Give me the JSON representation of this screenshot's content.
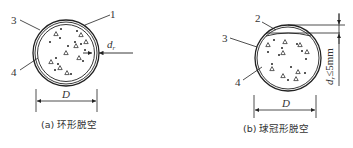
{
  "figure_a": {
    "caption": "(a) 环形脱空",
    "labels": {
      "one": "1",
      "three": "3",
      "four": "4"
    },
    "gap_label": "d",
    "gap_subscript": "r",
    "dimension_label": "D"
  },
  "figure_b": {
    "caption": "(b) 球冠形脱空",
    "labels": {
      "two": "2",
      "three": "3",
      "four": "4"
    },
    "gap_label": "d",
    "gap_subscript": "r",
    "gap_constraint": "≤5mm",
    "dimension_label": "D"
  },
  "legend_meaning": {
    "1": "annular void gap",
    "2": "crown-shaped void",
    "3": "steel tube",
    "4": "concrete core"
  },
  "colors": {
    "line": "#222222",
    "background": "#ffffff"
  }
}
